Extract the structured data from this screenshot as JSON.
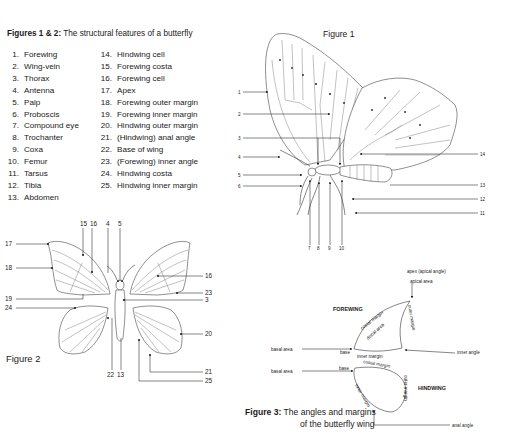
{
  "figures_1_2": {
    "caption_bold": "Figures 1 & 2:",
    "caption_rest": " The structural features of a butterfly",
    "legend_col1": [
      {
        "num": "1.",
        "label": "Forewing"
      },
      {
        "num": "2.",
        "label": "Wing-vein"
      },
      {
        "num": "3.",
        "label": "Thorax"
      },
      {
        "num": "4.",
        "label": "Antenna"
      },
      {
        "num": "5.",
        "label": "Palp"
      },
      {
        "num": "6.",
        "label": "Proboscis"
      },
      {
        "num": "7.",
        "label": "Compound eye"
      },
      {
        "num": "8.",
        "label": "Trochanter"
      },
      {
        "num": "9.",
        "label": "Coxa"
      },
      {
        "num": "10.",
        "label": "Femur"
      },
      {
        "num": "11.",
        "label": "Tarsus"
      },
      {
        "num": "12.",
        "label": "Tibia"
      },
      {
        "num": "13.",
        "label": "Abdomen"
      }
    ],
    "legend_col2": [
      {
        "num": "14.",
        "label": "Hindwing cell"
      },
      {
        "num": "15.",
        "label": "Forewing costa"
      },
      {
        "num": "16.",
        "label": "Forewing cell"
      },
      {
        "num": "17.",
        "label": "Apex"
      },
      {
        "num": "18.",
        "label": "Forewing outer margin"
      },
      {
        "num": "19.",
        "label": "Forewing inner margin"
      },
      {
        "num": "20.",
        "label": "Hindwing outer margin"
      },
      {
        "num": "21.",
        "label": "(Hindwing) anal angle"
      },
      {
        "num": "22.",
        "label": "Base of wing"
      },
      {
        "num": "23.",
        "label": "(Forewing) inner angle"
      },
      {
        "num": "24.",
        "label": "Hindwing costa"
      },
      {
        "num": "25.",
        "label": "Hindwing inner margin"
      }
    ]
  },
  "figure1": {
    "title": "Figure 1",
    "left_labels": [
      "1",
      "2",
      "3",
      "4",
      "5",
      "6"
    ],
    "right_labels": [
      "14",
      "13",
      "12",
      "11"
    ],
    "bottom_labels": [
      "7",
      "8",
      "9",
      "10"
    ]
  },
  "figure2": {
    "title": "Figure 2",
    "top_labels": [
      "15",
      "16",
      "4",
      "5"
    ],
    "left_labels": [
      "17",
      "18",
      "19",
      "24"
    ],
    "right_labels": [
      "16",
      "23",
      "3",
      "20",
      "21",
      "25"
    ],
    "bottom_labels": [
      "22",
      "13"
    ]
  },
  "figure3": {
    "caption_bold": "Figure 3:",
    "caption_line1": " The angles and margins",
    "caption_line2": "of the butterfly wing",
    "labels": {
      "apex": "apex (apical angle)",
      "apical_area": "apical area",
      "forewing": "FOREWING",
      "costal_margin_fw": "costal margin",
      "discal_area": "discal area",
      "outer_margin_fw": "outer margin",
      "basal_area_fw": "basal area",
      "base_fw": "base",
      "inner_margin_fw": "inner margin",
      "inner_angle": "inner angle",
      "costal_margin_hw": "costal margin",
      "basal_area_hw": "basal area",
      "base_hw": "base",
      "hindwing": "HINDWING",
      "outer_margin_hw": "outer margin",
      "inner_margin_hw": "inner margin",
      "anal_angle": "anal angle"
    }
  }
}
